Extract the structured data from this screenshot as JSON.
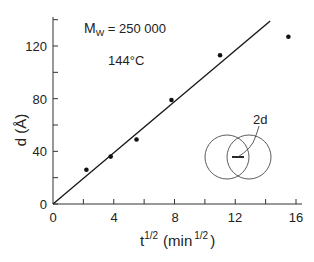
{
  "chart_data": {
    "type": "scatter",
    "title": "",
    "xlabel": "t^1/2 (min^1/2)",
    "ylabel": "d (Å)",
    "xlim": [
      0,
      16
    ],
    "ylim": [
      0,
      142
    ],
    "x_ticks": [
      0,
      4,
      8,
      12,
      16
    ],
    "x_minor_ticks": [
      2,
      6,
      10,
      14
    ],
    "y_ticks": [
      0,
      40,
      80,
      120
    ],
    "y_minor_ticks": [
      20,
      60,
      100,
      140
    ],
    "grid": false,
    "series": [
      {
        "name": "measured",
        "type": "scatter",
        "x": [
          2.2,
          3.8,
          5.5,
          7.8,
          11.0,
          15.5
        ],
        "y": [
          26,
          36,
          49,
          79,
          113,
          127
        ]
      },
      {
        "name": "linear fit",
        "type": "line",
        "x": [
          0,
          14.3
        ],
        "y": [
          0,
          139
        ]
      }
    ],
    "annotations": [
      "Mw = 250 000",
      "144°C",
      "2d"
    ]
  },
  "labels": {
    "x_tick_labels": [
      "0",
      "4",
      "8",
      "12",
      "16"
    ],
    "y_tick_labels": [
      "0",
      "40",
      "80",
      "120"
    ],
    "x_axis_main": "t",
    "x_axis_sup": "1/2",
    "x_axis_unit_open": "(min",
    "x_axis_unit_sup": "1/2",
    "x_axis_unit_close": ")",
    "y_axis": "d (Å)",
    "mw_prefix": "M",
    "mw_sub": "W",
    "mw_value": " = 250 000",
    "temperature": "144°C",
    "inset_label": "2d"
  }
}
